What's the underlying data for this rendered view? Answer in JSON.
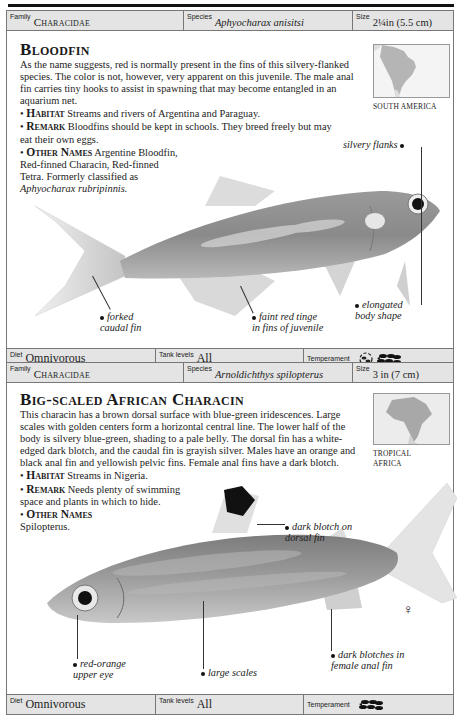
{
  "entries": [
    {
      "header": {
        "family_label": "Family",
        "family_value": "Characidae",
        "species_label": "Species",
        "species_value": "Aphyocharax anisitsi",
        "size_label": "Size",
        "size_value": "2¼in (5.5 cm)"
      },
      "title": "Bloodfin",
      "description": "As the name suggests, red is normally present in the fins of this silvery-flanked species. The color is not, however, very apparent on this juvenile. The male anal fin carries tiny hooks to assist in spawning that may become entangled in an aquarium net.",
      "habitat_label": "Habitat",
      "habitat_text": "Streams and rivers of Argentina and Paraguay.",
      "remark_label": "Remark",
      "remark_text": "Bloodfins should be kept in schools. They breed freely but may eat their own eggs.",
      "other_names_label": "Other Names",
      "other_names_text": "Argentine Bloodfin, Red-finned Characin, Red-finned Tetra. Formerly classified as",
      "other_names_italic": "Aphyocharax rubripinnis.",
      "map_label": "SOUTH AMERICA",
      "annotations": {
        "silvery_flanks": "silvery flanks",
        "forked_caudal_1": "forked",
        "forked_caudal_2": "caudal fin",
        "faint_red_1": "faint red tinge",
        "faint_red_2": "in fins of juvenile",
        "elongated_1": "elongated",
        "elongated_2": "body shape"
      },
      "footer": {
        "diet_label": "Diet",
        "diet_value": "Omnivorous",
        "tank_label": "Tank levels",
        "tank_value": "All",
        "temperament_label": "Temperament",
        "temperament_icons": [
          "community-fish-icon",
          "school-fish-icon"
        ]
      }
    },
    {
      "header": {
        "family_label": "Family",
        "family_value": "Characidae",
        "species_label": "Species",
        "species_value": "Arnoldichthys spilopterus",
        "size_label": "Size",
        "size_value": "3 in (7 cm)"
      },
      "title": "Big-scaled African Characin",
      "description": "This characin has a brown dorsal surface with blue-green iridescences. Large scales with golden centers form a horizontal central line. The lower half of the body is silvery blue-green, shading to a pale belly. The dorsal fin has a white-edged dark blotch, and the caudal fin is grayish silver. Males have an orange and black anal fin and yellowish pelvic fins. Female anal fins have a dark blotch.",
      "habitat_label": "Habitat",
      "habitat_text": "Streams in Nigeria.",
      "remark_label": "Remark",
      "remark_text": "Needs plenty of swimming space and plants in which to hide.",
      "other_names_label": "Other Names",
      "other_names_text": "Spilopterus.",
      "map_label_1": "TROPICAL",
      "map_label_2": "AFRICA",
      "female_symbol": "♀",
      "annotations": {
        "dark_blotch_1": "dark blotch on",
        "dark_blotch_2": "dorsal fin",
        "red_orange_1": "red-orange",
        "red_orange_2": "upper eye",
        "large_scales": "large scales",
        "dark_blotches_1": "dark blotches in",
        "dark_blotches_2": "female anal fin"
      },
      "footer": {
        "diet_label": "Diet",
        "diet_value": "Omnivorous",
        "tank_label": "Tank levels",
        "tank_value": "All",
        "temperament_label": "Temperament",
        "temperament_icons": [
          "school-fish-icon"
        ]
      }
    }
  ],
  "colors": {
    "bar_bg": "#e4e4e4",
    "border": "#777777",
    "text": "#1a1a1a"
  }
}
